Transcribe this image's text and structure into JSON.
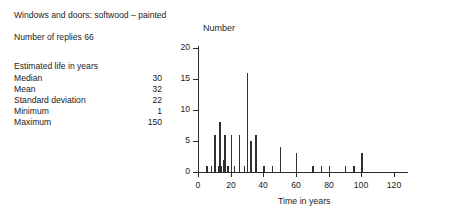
{
  "header": {
    "title": "Windows and doors: softwood – painted",
    "replies": "Number of replies 66"
  },
  "stats": {
    "heading": "Estimated life in years",
    "rows": [
      {
        "label": "Median",
        "value": "30"
      },
      {
        "label": "Mean",
        "value": "32"
      },
      {
        "label": "Standard deviation",
        "value": "22"
      },
      {
        "label": "Minimum",
        "value": "1"
      },
      {
        "label": "Maximum",
        "value": "150"
      }
    ]
  },
  "chart_data": {
    "type": "bar",
    "title": "",
    "xlabel": "Time in years",
    "ylabel": "Number",
    "xlim": [
      0,
      120
    ],
    "ylim": [
      0,
      20
    ],
    "xticks": [
      "0",
      "20",
      "40",
      "60",
      "80",
      "100",
      "120"
    ],
    "xtick_values": [
      0,
      20,
      40,
      60,
      80,
      100,
      120
    ],
    "yticks": [
      "0",
      "5",
      "10",
      "15",
      "20"
    ],
    "ytick_values": [
      0,
      5,
      10,
      15,
      20
    ],
    "grid": false,
    "legend": false,
    "x": [
      5,
      8,
      10,
      12,
      13,
      14,
      15,
      16,
      18,
      20,
      22,
      25,
      28,
      30,
      32,
      35,
      40,
      45,
      50,
      60,
      70,
      75,
      80,
      90,
      95,
      100
    ],
    "values": [
      1,
      1,
      6,
      1,
      8,
      1,
      2,
      6,
      1,
      6,
      1,
      6,
      1,
      16,
      5,
      6,
      1,
      1,
      4,
      3,
      1,
      1,
      1,
      1,
      1,
      3
    ],
    "categories": [
      "5",
      "8",
      "10",
      "12",
      "13",
      "14",
      "15",
      "16",
      "18",
      "20",
      "22",
      "25",
      "28",
      "30",
      "32",
      "35",
      "40",
      "45",
      "50",
      "60",
      "70",
      "75",
      "80",
      "90",
      "95",
      "100"
    ]
  }
}
